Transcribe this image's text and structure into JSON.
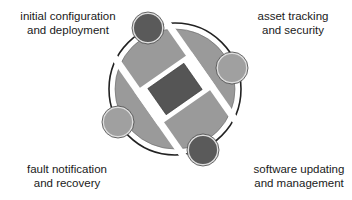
{
  "diagram": {
    "type": "cycle-diagram",
    "labels": {
      "top_left": {
        "line1": "initial configuration",
        "line2": "and deployment"
      },
      "top_right": {
        "line1": "asset tracking",
        "line2": "and security"
      },
      "bottom_left": {
        "line1": "fault notification",
        "line2": "and recovery"
      },
      "bottom_right": {
        "line1": "software updating",
        "line2": "and management"
      }
    },
    "nodes": [
      {
        "position": "top-left",
        "shade": "dark"
      },
      {
        "position": "right",
        "shade": "light"
      },
      {
        "position": "left",
        "shade": "light"
      },
      {
        "position": "bottom",
        "shade": "dark"
      }
    ],
    "colors": {
      "disc": "#9a9a9a",
      "dark_node": "#5a5a5a",
      "light_node": "#a0a0a0",
      "center_square": "#555555",
      "ring_stroke": "#222222",
      "gap": "#ffffff"
    }
  }
}
